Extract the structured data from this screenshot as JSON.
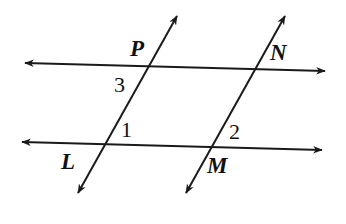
{
  "figure": {
    "kind": "geometry-diagram",
    "background_color": "#ffffff",
    "stroke_color": "#1a1a1a",
    "stroke_width": 2,
    "width": 346,
    "height": 224
  },
  "lines": [
    {
      "name": "top-horizontal-line",
      "x1": 25,
      "y1": 63,
      "x2": 325,
      "y2": 71,
      "arrow_start": true,
      "arrow_end": true
    },
    {
      "name": "bottom-horizontal-line",
      "x1": 22,
      "y1": 142,
      "x2": 322,
      "y2": 150,
      "arrow_start": true,
      "arrow_end": true
    },
    {
      "name": "left-transversal-line",
      "x1": 78,
      "y1": 193,
      "x2": 177,
      "y2": 16,
      "arrow_start": true,
      "arrow_end": true
    },
    {
      "name": "right-transversal-line",
      "x1": 186,
      "y1": 193,
      "x2": 285,
      "y2": 16,
      "arrow_start": true,
      "arrow_end": true
    }
  ],
  "point_labels": [
    {
      "name": "label-P",
      "text": "P",
      "x": 130,
      "y": 37
    },
    {
      "name": "label-N",
      "text": "N",
      "x": 270,
      "y": 41
    },
    {
      "name": "label-L",
      "text": "L",
      "x": 61,
      "y": 150
    },
    {
      "name": "label-M",
      "text": "M",
      "x": 207,
      "y": 154
    }
  ],
  "angle_labels": [
    {
      "name": "angle-label-3",
      "text": "3",
      "x": 114,
      "y": 74
    },
    {
      "name": "angle-label-1",
      "text": "1",
      "x": 121,
      "y": 119
    },
    {
      "name": "angle-label-2",
      "text": "2",
      "x": 229,
      "y": 121
    }
  ]
}
